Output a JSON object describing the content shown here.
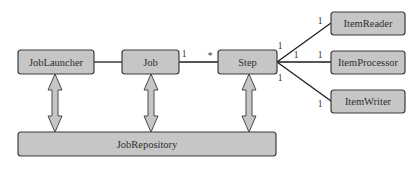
{
  "diagram": {
    "type": "uml-class-relationships",
    "nodes": [
      {
        "id": "joblauncher",
        "label": "JobLauncher"
      },
      {
        "id": "job",
        "label": "Job"
      },
      {
        "id": "step",
        "label": "Step"
      },
      {
        "id": "itemreader",
        "label": "ItemReader"
      },
      {
        "id": "itemprocessor",
        "label": "ItemProcessor"
      },
      {
        "id": "itemwriter",
        "label": "ItemWriter"
      },
      {
        "id": "jobrepository",
        "label": "JobRepository"
      }
    ],
    "edges": [
      {
        "from": "joblauncher",
        "to": "job",
        "from_mult": "",
        "to_mult": ""
      },
      {
        "from": "job",
        "to": "step",
        "from_mult": "1",
        "to_mult": "*"
      },
      {
        "from": "step",
        "to": "itemreader",
        "from_mult": "1",
        "to_mult": "1"
      },
      {
        "from": "step",
        "to": "itemprocessor",
        "from_mult": "1",
        "to_mult": "1"
      },
      {
        "from": "step",
        "to": "itemwriter",
        "from_mult": "1",
        "to_mult": "1"
      }
    ],
    "bidirectional_links": [
      {
        "from": "joblauncher",
        "to": "jobrepository"
      },
      {
        "from": "job",
        "to": "jobrepository"
      },
      {
        "from": "step",
        "to": "jobrepository"
      }
    ]
  }
}
